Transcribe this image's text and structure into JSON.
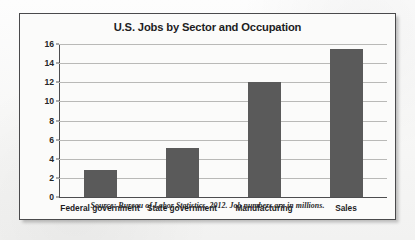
{
  "figure": {
    "title": "U.S. Jobs by Sector and Occupation",
    "source_note": "Source: Bureau of Labor Statistics, 2012.   Job numbers are in millions.",
    "frame_color": "#4a4a4c",
    "page_background": "#fbfbfa"
  },
  "chart_data": {
    "type": "bar",
    "title": "U.S. Jobs by Sector and Occupation",
    "subtitle": "",
    "xlabel": "",
    "ylabel": "",
    "categories": [
      "Federal government",
      "State government",
      "Manufacturing",
      "Sales"
    ],
    "values": [
      2.8,
      5.1,
      12.0,
      15.5
    ],
    "units": "millions of jobs",
    "ylim": [
      0,
      16
    ],
    "ytick_values": [
      0,
      2,
      4,
      6,
      8,
      10,
      12,
      14,
      16
    ],
    "ytick_labels": [
      "0",
      "2",
      "4",
      "6",
      "8",
      "10",
      "12",
      "14",
      "16"
    ],
    "grid": true,
    "grid_axis": "y",
    "legend": false,
    "legend_position": "none",
    "bar_color": "#5a5a5a",
    "gridline_color": "#b9b9b7",
    "axis_color": "#4d4d4f",
    "annotations": [
      "Source: Bureau of Labor Statistics, 2012.   Job numbers are in millions."
    ]
  }
}
